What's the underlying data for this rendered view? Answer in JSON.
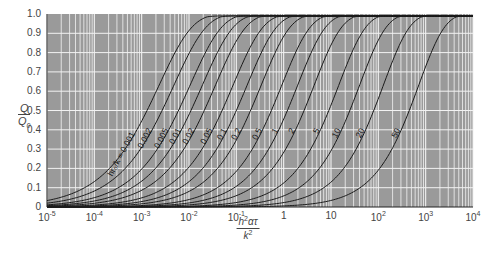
{
  "chart_data": {
    "type": "line",
    "title": "",
    "xlabel": "h²ατ / k²",
    "ylabel": "Q / Q₀",
    "xscale": "log",
    "xlim": [
      1e-05,
      10000
    ],
    "ylim": [
      0,
      1.0
    ],
    "grid": true,
    "legend": "inline curve labels",
    "parameter_label": "hr₀/k",
    "x_ticks": [
      {
        "value": 1e-05,
        "label": "10",
        "exp": "-5"
      },
      {
        "value": 0.0001,
        "label": "10",
        "exp": "-4"
      },
      {
        "value": 0.001,
        "label": "10",
        "exp": "-3"
      },
      {
        "value": 0.01,
        "label": "10",
        "exp": "-2"
      },
      {
        "value": 0.1,
        "label": "10",
        "exp": "-1"
      },
      {
        "value": 1,
        "label": "1",
        "exp": ""
      },
      {
        "value": 10,
        "label": "10",
        "exp": ""
      },
      {
        "value": 100,
        "label": "10",
        "exp": "2"
      },
      {
        "value": 1000,
        "label": "10",
        "exp": "3"
      },
      {
        "value": 10000,
        "label": "10",
        "exp": "4"
      }
    ],
    "y_ticks": [
      "0",
      "0.1",
      "0.2",
      "0.3",
      "0.4",
      "0.5",
      "0.6",
      "0.7",
      "0.8",
      "0.9",
      "1.0"
    ],
    "series": [
      {
        "name": "hr₀/k = 0.001",
        "label": "hr₀/k = 0.001",
        "x_at_half": 0.0013
      },
      {
        "name": "0.002",
        "label": "0.002",
        "x_at_half": 0.0027
      },
      {
        "name": "0.005",
        "label": "0.005",
        "x_at_half": 0.006
      },
      {
        "name": "0.01",
        "label": "0.01",
        "x_at_half": 0.011
      },
      {
        "name": "0.02",
        "label": "0.02",
        "x_at_half": 0.021
      },
      {
        "name": "0.05",
        "label": "0.05",
        "x_at_half": 0.05
      },
      {
        "name": "0.1",
        "label": "0.1",
        "x_at_half": 0.1
      },
      {
        "name": "0.2",
        "label": "0.2",
        "x_at_half": 0.2
      },
      {
        "name": "0.5",
        "label": "0.5",
        "x_at_half": 0.55
      },
      {
        "name": "1",
        "label": "1",
        "x_at_half": 1.2
      },
      {
        "name": "2",
        "label": "2",
        "x_at_half": 2.7
      },
      {
        "name": "5",
        "label": "5",
        "x_at_half": 9
      },
      {
        "name": "10",
        "label": "10",
        "x_at_half": 25
      },
      {
        "name": "20",
        "label": "20",
        "x_at_half": 80
      },
      {
        "name": "50",
        "label": "50",
        "x_at_half": 450
      }
    ]
  },
  "axes": {
    "ylabel_num": "Q",
    "ylabel_den": "Q",
    "ylabel_den_sub": "0",
    "xlabel_num_a": "h",
    "xlabel_num_sup": "2",
    "xlabel_num_b": "ατ",
    "xlabel_den": "k",
    "xlabel_den_sup": "2"
  },
  "colors": {
    "plot_bg": "#9a9a9a",
    "grid": "#f2f2f2",
    "curve": "#1a1a1a",
    "axis_text": "#444444"
  }
}
